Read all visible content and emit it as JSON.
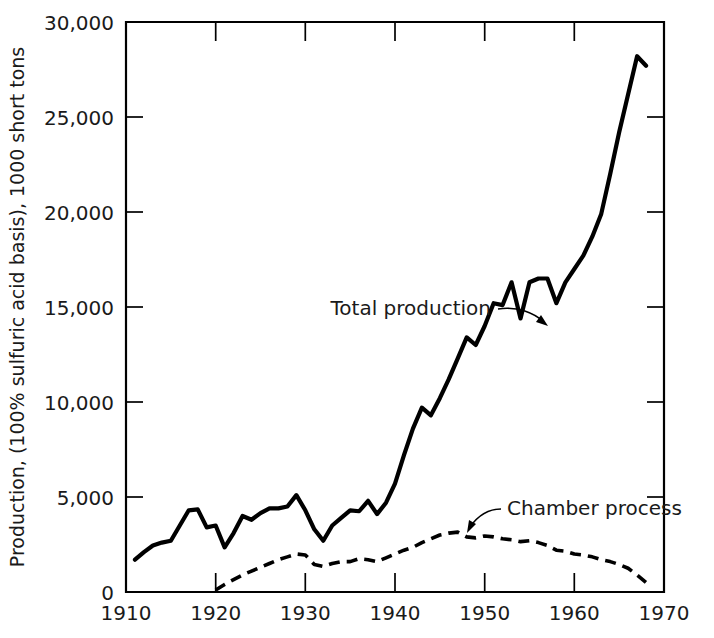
{
  "chart_data": {
    "type": "line",
    "title": "",
    "xlabel": "",
    "ylabel": "Production, (100% sulfuric acid basis), 1000 short tons",
    "xlim": [
      1910,
      1970
    ],
    "ylim": [
      0,
      30000
    ],
    "grid": false,
    "legend_position": "inline-annotations",
    "x_ticks": [
      "1910",
      "1920",
      "1930",
      "1940",
      "1950",
      "1960",
      "1970"
    ],
    "x_tick_values": [
      1910,
      1920,
      1930,
      1940,
      1950,
      1960,
      1970
    ],
    "y_ticks": [
      "0",
      "5,000",
      "10,000",
      "15,000",
      "20,000",
      "25,000",
      "30,000"
    ],
    "y_tick_values": [
      0,
      5000,
      10000,
      15000,
      20000,
      25000,
      30000
    ],
    "annotations": [
      {
        "text": "Total production",
        "points_to_series": "Total production",
        "points_to_x": 1954,
        "points_to_y": 15300
      },
      {
        "text": "Chamber process",
        "points_to_series": "Chamber process",
        "points_to_x": 1947,
        "points_to_y": 3100
      }
    ],
    "series": [
      {
        "name": "Total production",
        "style": "solid",
        "x": [
          1911,
          1912,
          1913,
          1914,
          1915,
          1916,
          1917,
          1918,
          1919,
          1920,
          1921,
          1922,
          1923,
          1924,
          1925,
          1926,
          1927,
          1928,
          1929,
          1930,
          1931,
          1932,
          1933,
          1934,
          1935,
          1936,
          1937,
          1938,
          1939,
          1940,
          1941,
          1942,
          1943,
          1944,
          1945,
          1946,
          1947,
          1948,
          1949,
          1950,
          1951,
          1952,
          1953,
          1954,
          1955,
          1956,
          1957,
          1958,
          1959,
          1960,
          1961,
          1962,
          1963,
          1964,
          1965,
          1966,
          1967,
          1968
        ],
        "values": [
          1700,
          2100,
          2450,
          2600,
          2700,
          3500,
          4300,
          4350,
          3400,
          3500,
          2350,
          3100,
          4000,
          3800,
          4150,
          4400,
          4400,
          4500,
          5100,
          4300,
          3300,
          2700,
          3500,
          3900,
          4300,
          4250,
          4800,
          4100,
          4700,
          5700,
          7200,
          8600,
          9700,
          9300,
          10200,
          11200,
          12300,
          13400,
          13000,
          14000,
          15200,
          15100,
          16300,
          14400,
          16300,
          16500,
          16500,
          15200,
          16300,
          17000,
          17700,
          18700,
          19900,
          22000,
          24200,
          26200,
          28200,
          27700
        ]
      },
      {
        "name": "Chamber process",
        "style": "dashed",
        "x": [
          1920,
          1921,
          1922,
          1923,
          1924,
          1925,
          1926,
          1927,
          1928,
          1929,
          1930,
          1931,
          1932,
          1933,
          1934,
          1935,
          1936,
          1937,
          1938,
          1939,
          1940,
          1941,
          1942,
          1943,
          1944,
          1945,
          1946,
          1947,
          1948,
          1949,
          1950,
          1951,
          1952,
          1953,
          1954,
          1955,
          1956,
          1957,
          1958,
          1959,
          1960,
          1961,
          1962,
          1963,
          1964,
          1965,
          1966,
          1967,
          1968
        ],
        "values": [
          100,
          400,
          650,
          900,
          1100,
          1300,
          1500,
          1700,
          1850,
          2000,
          1950,
          1450,
          1350,
          1500,
          1600,
          1600,
          1750,
          1700,
          1600,
          1800,
          2000,
          2200,
          2350,
          2600,
          2800,
          3000,
          3100,
          3150,
          2900,
          2850,
          2950,
          2900,
          2800,
          2750,
          2650,
          2700,
          2600,
          2450,
          2200,
          2150,
          2000,
          1950,
          1850,
          1700,
          1600,
          1450,
          1250,
          900,
          500
        ]
      }
    ]
  },
  "axes": {
    "y_axis_title": "Production, (100% sulfuric acid basis), 1000 short tons"
  }
}
